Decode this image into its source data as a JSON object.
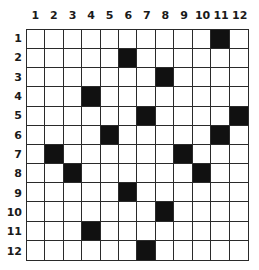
{
  "grid": {
    "rows": 12,
    "cols": 12,
    "col_labels": [
      "1",
      "2",
      "3",
      "4",
      "5",
      "6",
      "7",
      "8",
      "9",
      "10",
      "11",
      "12"
    ],
    "row_labels": [
      "1",
      "2",
      "3",
      "4",
      "5",
      "6",
      "7",
      "8",
      "9",
      "10",
      "11",
      "12"
    ],
    "filled_color": "#111111",
    "empty_color": "#ffffff",
    "line_color": "#2a2a2a",
    "filled_cells": [
      {
        "row": 1,
        "col": 11
      },
      {
        "row": 2,
        "col": 6
      },
      {
        "row": 3,
        "col": 8
      },
      {
        "row": 4,
        "col": 4
      },
      {
        "row": 5,
        "col": 7
      },
      {
        "row": 5,
        "col": 12
      },
      {
        "row": 6,
        "col": 5
      },
      {
        "row": 6,
        "col": 11
      },
      {
        "row": 7,
        "col": 2
      },
      {
        "row": 7,
        "col": 9
      },
      {
        "row": 8,
        "col": 3
      },
      {
        "row": 8,
        "col": 10
      },
      {
        "row": 9,
        "col": 6
      },
      {
        "row": 10,
        "col": 8
      },
      {
        "row": 11,
        "col": 4
      },
      {
        "row": 12,
        "col": 7
      }
    ]
  }
}
